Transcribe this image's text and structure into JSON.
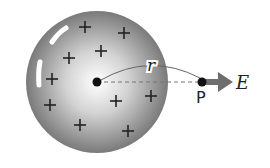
{
  "diagram": {
    "sphere": {
      "cx": 97,
      "cy": 82,
      "r": 71,
      "edge_color": "#7a7a7a",
      "center_color": "#ffffff"
    },
    "center_point": {
      "cx": 97,
      "cy": 82
    },
    "charges": {
      "symbol": "+",
      "positions": [
        [
          85,
          27
        ],
        [
          124,
          33
        ],
        [
          69,
          58
        ],
        [
          101,
          51
        ],
        [
          52,
          79
        ],
        [
          50,
          105
        ],
        [
          80,
          125
        ],
        [
          116,
          101
        ],
        [
          151,
          96
        ],
        [
          128,
          131
        ]
      ]
    },
    "radius_label": "r",
    "point_label": "P",
    "field_label": "E",
    "point": {
      "cx": 202,
      "cy": 82
    },
    "arrow_color": "#6e6e6e"
  }
}
